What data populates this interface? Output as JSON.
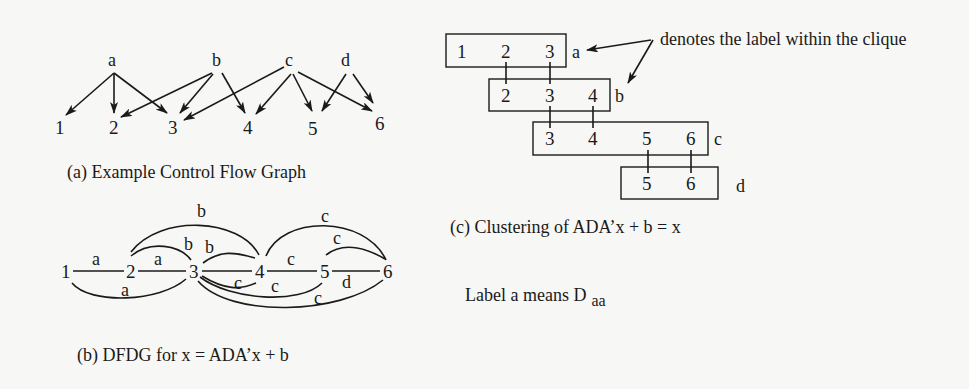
{
  "figure_a": {
    "caption": "(a) Example Control Flow Graph",
    "sources": [
      {
        "id": "a",
        "x": 113,
        "y": 66
      },
      {
        "id": "b",
        "x": 217,
        "y": 66
      },
      {
        "id": "c",
        "x": 290,
        "y": 66
      },
      {
        "id": "d",
        "x": 347,
        "y": 66
      }
    ],
    "targets": [
      {
        "id": "1",
        "x": 60,
        "y": 134
      },
      {
        "id": "2",
        "x": 114,
        "y": 134
      },
      {
        "id": "3",
        "x": 173,
        "y": 134
      },
      {
        "id": "4",
        "x": 248,
        "y": 134
      },
      {
        "id": "5",
        "x": 313,
        "y": 135
      },
      {
        "id": "6",
        "x": 380,
        "y": 130
      }
    ],
    "edges": [
      [
        "a",
        "1"
      ],
      [
        "a",
        "2"
      ],
      [
        "a",
        "3"
      ],
      [
        "b",
        "2"
      ],
      [
        "b",
        "3"
      ],
      [
        "b",
        "4"
      ],
      [
        "c",
        "3"
      ],
      [
        "c",
        "4"
      ],
      [
        "c",
        "5"
      ],
      [
        "c",
        "6"
      ],
      [
        "d",
        "5"
      ],
      [
        "d",
        "6"
      ]
    ]
  },
  "figure_b": {
    "caption": "(b) DFDG for x = ADA’x + b",
    "nodes": [
      "1",
      "2",
      "3",
      "4",
      "5",
      "6"
    ],
    "edges": [
      {
        "from": "1",
        "to": "2",
        "label": "a"
      },
      {
        "from": "2",
        "to": "3",
        "label": "a"
      },
      {
        "from": "1",
        "to": "3",
        "label": "a"
      },
      {
        "from": "2",
        "to": "3",
        "label": "b"
      },
      {
        "from": "2",
        "to": "4",
        "label": "b"
      },
      {
        "from": "3",
        "to": "4",
        "label": "b"
      },
      {
        "from": "3",
        "to": "4",
        "label": "c"
      },
      {
        "from": "3",
        "to": "5",
        "label": "c"
      },
      {
        "from": "3",
        "to": "6",
        "label": "c"
      },
      {
        "from": "4",
        "to": "5",
        "label": "c"
      },
      {
        "from": "4",
        "to": "6",
        "label": "c"
      },
      {
        "from": "5",
        "to": "6",
        "label": "c"
      },
      {
        "from": "5",
        "to": "6",
        "label": "d"
      }
    ]
  },
  "figure_c": {
    "caption": "(c) Clustering of ADA’x + b = x",
    "annotation": "denotes the label within the clique",
    "cliques": [
      {
        "label": "a",
        "members": [
          "1",
          "2",
          "3"
        ]
      },
      {
        "label": "b",
        "members": [
          "2",
          "3",
          "4"
        ]
      },
      {
        "label": "c",
        "members": [
          "3",
          "4",
          "5",
          "6"
        ]
      },
      {
        "label": "d",
        "members": [
          "5",
          "6"
        ]
      }
    ]
  },
  "legend": {
    "text": "Label a means D",
    "subscript": "aa"
  }
}
